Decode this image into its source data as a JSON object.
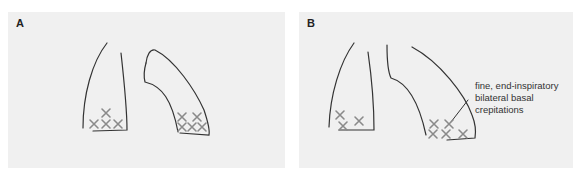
{
  "panels": [
    {
      "label": "A"
    },
    {
      "label": "B",
      "annotation": {
        "lines": [
          "fine, end-inspiratory",
          "bilateral basal",
          "crepitations"
        ]
      }
    }
  ],
  "colors": {
    "background": "#f0f0f0",
    "outline": "#333333",
    "crepitation_marker": "#8a8a8a"
  },
  "markers": {
    "symbol": "×",
    "meaning": "crepitations"
  }
}
